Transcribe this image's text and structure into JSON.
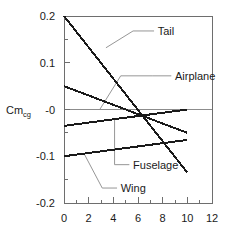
{
  "chart_data": {
    "type": "line",
    "title": "",
    "xlabel": "",
    "ylabel": "Cm",
    "ylabel_sub": "cg",
    "xlim": [
      0,
      12
    ],
    "ylim": [
      -0.2,
      0.2
    ],
    "grid": false,
    "legend": "inline-annotations",
    "xticks": [
      0,
      2,
      4,
      6,
      8,
      10,
      12
    ],
    "xtick_labels": [
      "0",
      "2",
      "4",
      "6",
      "8",
      "10",
      "12"
    ],
    "xminor_ticks": [
      1,
      3,
      5,
      7,
      9,
      11
    ],
    "yticks": [
      -0.2,
      -0.1,
      0,
      0.1,
      0.2
    ],
    "ytick_labels": [
      "-0.2",
      "-0.1",
      "-0",
      "0.1",
      "0.2"
    ],
    "yminor_ticks": [
      -0.15,
      -0.05,
      0.05,
      0.15
    ],
    "zero_line": 0,
    "series": [
      {
        "name": "Tail",
        "x": [
          0,
          10
        ],
        "values": [
          0.2,
          -0.135
        ],
        "label_x": 7.6,
        "label_y": 0.168
      },
      {
        "name": "Airplane",
        "x": [
          0,
          10
        ],
        "values": [
          0.05,
          -0.05
        ],
        "label_x": 9.0,
        "label_y": 0.072
      },
      {
        "name": "Fuselage",
        "x": [
          0,
          10
        ],
        "values": [
          -0.035,
          0.0
        ],
        "label_x": 5.6,
        "label_y": -0.118
      },
      {
        "name": "Wing",
        "x": [
          0,
          10
        ],
        "values": [
          -0.1,
          -0.065
        ],
        "label_x": 4.6,
        "label_y": -0.168
      }
    ],
    "annotations": [
      {
        "name": "Tail",
        "leader": [
          [
            7.3,
            0.168
          ],
          [
            5.6,
            0.168
          ],
          [
            3.4,
            0.132
          ]
        ]
      },
      {
        "name": "Airplane",
        "leader": [
          [
            8.7,
            0.072
          ],
          [
            7.2,
            0.072
          ],
          [
            4.6,
            0.072
          ],
          [
            2.9,
            0.0
          ]
        ]
      },
      {
        "name": "Fuselage",
        "leader": [
          [
            5.3,
            -0.118
          ],
          [
            4.1,
            -0.118
          ],
          [
            4.1,
            -0.022
          ]
        ]
      },
      {
        "name": "Wing",
        "leader": [
          [
            4.3,
            -0.168
          ],
          [
            3.1,
            -0.168
          ],
          [
            1.6,
            -0.093
          ]
        ]
      }
    ],
    "colors": {
      "series_line": "#1a1a1a",
      "axis": "#6e6e6e",
      "zero_line": "#8c8c8c",
      "leader": "#8a8a8a",
      "background": "#ffffff"
    }
  }
}
